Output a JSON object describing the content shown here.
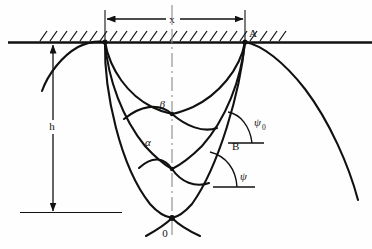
{
  "figure": {
    "background_color": "#fefefe",
    "line_color": "#111111",
    "centerline_color": "#8a8a8a"
  },
  "labels": {
    "span": "x",
    "depth": "h",
    "point_a": "A",
    "point_b": "B",
    "origin": "0",
    "alpha": "α",
    "beta": "β",
    "psi": "ψ",
    "psi_zero_base": "ψ",
    "psi_zero_sub": "0"
  },
  "geometry": {
    "ground_line_y": 42,
    "ground_line_x_start": 8,
    "ground_line_x_end": 372,
    "hatch_x_start": 40,
    "hatch_x_end": 286,
    "left_cusp": [
      105,
      42
    ],
    "right_cusp": [
      245,
      42
    ],
    "bottom_cusp": [
      172,
      218
    ],
    "point_b": [
      228,
      143
    ],
    "centerline_x": 172,
    "centerline_top": 5,
    "centerline_bottom": 236,
    "span_dimension_y": 19,
    "span_from_x": 105,
    "span_to_x": 245,
    "depth_dimension_x": 53,
    "depth_top_y": 43,
    "depth_bottom_y": 213,
    "depth_baseline_x_start": 20,
    "depth_baseline_x_end": 122
  },
  "angles": {
    "psi_zero_vertex": [
      228,
      143
    ],
    "psi_zero_ray_len": 36,
    "psi_zero_value_deg": 58,
    "psi_vertex": [
      215,
      187
    ],
    "psi_ray_len": 40,
    "psi_value_deg": 62
  }
}
